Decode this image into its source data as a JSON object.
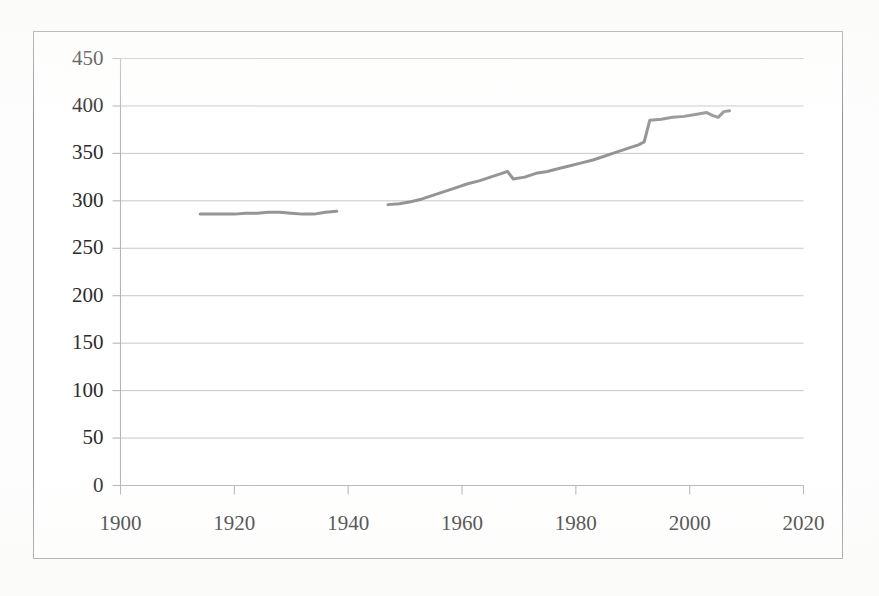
{
  "chart_data": {
    "type": "line",
    "title": "",
    "subtitle": "",
    "xlabel": "",
    "ylabel": "",
    "xlim": [
      1900,
      2020
    ],
    "ylim": [
      0,
      450
    ],
    "grid": true,
    "grid_axis": "y",
    "legend": false,
    "legend_position": "none",
    "line_color": "#8c8c8c",
    "line_width": 3,
    "axis_color": "#b5b5b5",
    "text_color": "#2b2b2b",
    "background": "#ffffff",
    "xticks": [
      1900,
      1920,
      1940,
      1960,
      1980,
      2000,
      2020
    ],
    "xtick_labels": [
      "1900",
      "1920",
      "1940",
      "1960",
      "1980",
      "2000",
      "2020"
    ],
    "yticks": [
      0,
      50,
      100,
      150,
      200,
      250,
      300,
      350,
      400,
      450
    ],
    "ytick_labels": [
      "0",
      "50",
      "100",
      "150",
      "200",
      "250",
      "300",
      "350",
      "400",
      "450"
    ],
    "series": [
      {
        "name": "early-record",
        "color": "#8c8c8c",
        "x": [
          1914,
          1916,
          1918,
          1920,
          1922,
          1924,
          1926,
          1928,
          1930,
          1932,
          1934,
          1936,
          1938
        ],
        "y": [
          286,
          286,
          286,
          286,
          287,
          287,
          288,
          288,
          287,
          286,
          286,
          288,
          289
        ]
      },
      {
        "name": "modern-record",
        "color": "#8c8c8c",
        "x": [
          1947,
          1949,
          1951,
          1953,
          1955,
          1957,
          1959,
          1961,
          1963,
          1965,
          1967,
          1968,
          1969,
          1971,
          1973,
          1975,
          1977,
          1979,
          1981,
          1983,
          1985,
          1987,
          1989,
          1991,
          1992,
          1993,
          1995,
          1997,
          1999,
          2001,
          2003,
          2004,
          2005,
          2006,
          2007
        ],
        "y": [
          296,
          297,
          299,
          302,
          306,
          310,
          314,
          318,
          321,
          325,
          329,
          331,
          323,
          325,
          329,
          331,
          334,
          337,
          340,
          343,
          347,
          351,
          355,
          359,
          362,
          385,
          386,
          388,
          389,
          391,
          393,
          390,
          388,
          394,
          395
        ]
      }
    ],
    "annotations": [
      {
        "label": "data-gap",
        "x_from": 1938,
        "x_to": 1947
      },
      {
        "label": "dip-1968",
        "x": 1968,
        "from_y": 331,
        "to_y": 323
      },
      {
        "label": "step-1992",
        "x": 1992,
        "from_y": 362,
        "to_y": 385
      }
    ]
  },
  "axes": {
    "y_tick_values": [
      450,
      400,
      350,
      300,
      250,
      200,
      150,
      100,
      50,
      0
    ],
    "x_tick_values": [
      1900,
      1920,
      1940,
      1960,
      1980,
      2000,
      2020
    ]
  }
}
